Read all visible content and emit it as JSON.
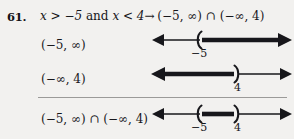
{
  "problem": {
    "number": "61.",
    "statement_lhs": "x > −5",
    "statement_conj": "and",
    "statement_rhs": "x < 4",
    "statement_arrow": "→",
    "statement_result": "(−5, ∞) ∩ (−∞, 4)"
  },
  "rows": [
    {
      "label": "(−5, ∞)",
      "graph": {
        "type": "number-line",
        "left_arrow": true,
        "right_arrow": true,
        "shaded": [
          {
            "from": -5,
            "to": "inf"
          }
        ],
        "endpoints": [
          {
            "value": -5,
            "bracket": "(",
            "closed": false,
            "tick_label": "−5"
          }
        ]
      }
    },
    {
      "label": "(−∞, 4)",
      "graph": {
        "type": "number-line",
        "left_arrow": true,
        "right_arrow": true,
        "shaded": [
          {
            "from": "-inf",
            "to": 4
          }
        ],
        "endpoints": [
          {
            "value": 4,
            "bracket": ")",
            "closed": false,
            "tick_label": "4"
          }
        ]
      }
    },
    {
      "label": "(−5, ∞) ∩ (−∞, 4)",
      "graph": {
        "type": "number-line",
        "left_arrow": true,
        "right_arrow": true,
        "shaded": [
          {
            "from": -5,
            "to": 4
          }
        ],
        "endpoints": [
          {
            "value": -5,
            "bracket": "(",
            "closed": false,
            "tick_label": "−5"
          },
          {
            "value": 4,
            "bracket": ")",
            "closed": false,
            "tick_label": "4"
          }
        ]
      }
    }
  ],
  "colors": {
    "ink": "#17171b",
    "paper": "#f2f1ef",
    "rule": "#9b9a98"
  }
}
